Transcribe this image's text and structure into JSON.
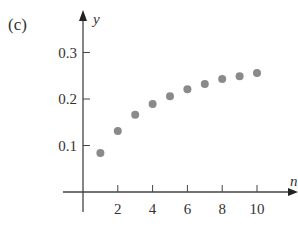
{
  "panel_label": "(c)",
  "chart_data": {
    "type": "scatter",
    "title": "",
    "xlabel": "n",
    "ylabel": "y",
    "x": [
      1,
      2,
      3,
      4,
      5,
      6,
      7,
      8,
      9,
      10
    ],
    "y": [
      0.084,
      0.131,
      0.166,
      0.189,
      0.206,
      0.221,
      0.232,
      0.243,
      0.249,
      0.256
    ],
    "xticks": [
      2,
      4,
      6,
      8,
      10
    ],
    "xtick_labels": [
      "2",
      "4",
      "6",
      "8",
      "10"
    ],
    "yticks": [
      0.1,
      0.2,
      0.3
    ],
    "ytick_labels": [
      "0.1",
      "0.2",
      "0.3"
    ],
    "xlim": [
      -1.5,
      12
    ],
    "ylim": [
      -0.07,
      0.33
    ],
    "grid": false,
    "legend": null,
    "marker_color": "#8a8a8a",
    "axis_color": "#444444"
  }
}
